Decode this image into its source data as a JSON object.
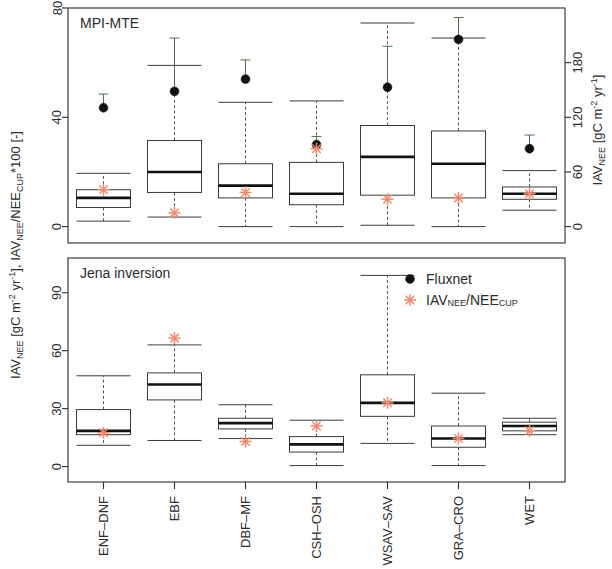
{
  "figure": {
    "left_axis_title": "IAV_NEE [gC m-2 yr-1], IAV_NEE/NEE_CUP*100 [-]",
    "right_axis_title": "IAV_NEE [gC m-2 yr-1]"
  },
  "legend": {
    "items": [
      {
        "label": "Fluxnet",
        "marker": "filled-circle",
        "color": "#111111"
      },
      {
        "label": "IAV_NEE/NEE_CUP",
        "marker": "asterisk",
        "color": "#f08a6e"
      }
    ]
  },
  "axis_text": {
    "left_part1": "IAV",
    "left_part1_sub": "NEE",
    "left_part2": " [gC m",
    "left_sup_m": "-2",
    "left_part3": " yr",
    "left_sup_y": "-1",
    "left_part4": "], IAV",
    "left_part4_sub": "NEE",
    "left_part5": "/NEE",
    "left_part5_sub": "CUP",
    "left_part6": "*100 [-]",
    "right_part1": "IAV",
    "right_part1_sub": "NEE",
    "right_part2": " [gC m",
    "right_sup_m": "-2",
    "right_part3": " yr",
    "right_sup_y": "-1",
    "right_part4": "]",
    "legend2_p1": "IAV",
    "legend2_s1": "NEE",
    "legend2_p2": "/NEE",
    "legend2_s2": "CUP"
  },
  "chart_data": [
    {
      "type": "box",
      "panel": "top",
      "title": "MPI-MTE",
      "xlabel": "",
      "ylabel": "IAV_NEE/NEE_CUP*100 [-]",
      "ylim": [
        -6,
        80
      ],
      "yticks": [
        0,
        40,
        80
      ],
      "y2label": "IAV_NEE [gC m-2 yr-1]",
      "y2lim": [
        -18,
        240
      ],
      "y2ticks": [
        0,
        60,
        120,
        180
      ],
      "grid": false,
      "categories": [
        "ENF-DNF",
        "EBF",
        "DBF-MF",
        "CSH-OSH",
        "WSAV-SAV",
        "GRA-CRO",
        "WET"
      ],
      "boxes": [
        {
          "category": "ENF-DNF",
          "whisker_low": 2.0,
          "q1": 7.0,
          "median": 10.5,
          "q3": 13.5,
          "whisker_high": 19.5
        },
        {
          "category": "EBF",
          "whisker_low": 3.5,
          "q1": 12.5,
          "median": 20.0,
          "q3": 31.5,
          "whisker_high": 59.0
        },
        {
          "category": "DBF-MF",
          "whisker_low": 0.0,
          "q1": 10.5,
          "median": 15.0,
          "q3": 23.0,
          "whisker_high": 45.5
        },
        {
          "category": "CSH-OSH",
          "whisker_low": 0.0,
          "q1": 8.0,
          "median": 12.0,
          "q3": 23.5,
          "whisker_high": 46.0
        },
        {
          "category": "WSAV-SAV",
          "whisker_low": 0.5,
          "q1": 11.5,
          "median": 25.5,
          "q3": 37.0,
          "whisker_high": 74.5
        },
        {
          "category": "GRA-CRO",
          "whisker_low": 0.0,
          "q1": 10.5,
          "median": 23.0,
          "q3": 35.0,
          "whisker_high": 69.0
        },
        {
          "category": "WET",
          "whisker_low": 6.0,
          "q1": 10.0,
          "median": 12.0,
          "q3": 14.5,
          "whisker_high": 20.5
        }
      ],
      "fluxnet_points": [
        {
          "category": "ENF-DNF",
          "value": 43.5,
          "err_high": 48.5
        },
        {
          "category": "EBF",
          "value": 49.5,
          "err_high": 69.0
        },
        {
          "category": "DBF-MF",
          "value": 54.0,
          "err_high": 61.0
        },
        {
          "category": "CSH-OSH",
          "value": 30.0,
          "err_high": 33.0
        },
        {
          "category": "WSAV-SAV",
          "value": 51.0,
          "err_high": 66.0
        },
        {
          "category": "GRA-CRO",
          "value": 68.5,
          "err_high": 76.5
        },
        {
          "category": "WET",
          "value": 28.5,
          "err_high": 33.5
        }
      ],
      "ratio_points": [
        {
          "category": "ENF-DNF",
          "value": 13.5
        },
        {
          "category": "EBF",
          "value": 5.0
        },
        {
          "category": "DBF-MF",
          "value": 12.5
        },
        {
          "category": "CSH-OSH",
          "value": 28.5
        },
        {
          "category": "WSAV-SAV",
          "value": 10.0
        },
        {
          "category": "GRA-CRO",
          "value": 10.5
        },
        {
          "category": "WET",
          "value": 12.0
        }
      ]
    },
    {
      "type": "box",
      "panel": "bottom",
      "title": "Jena inversion",
      "xlabel": "",
      "ylabel": "IAV_NEE [gC m-2 yr-1]",
      "ylim": [
        -8,
        108
      ],
      "yticks": [
        0,
        30,
        60,
        90
      ],
      "grid": false,
      "categories": [
        "ENF-DNF",
        "EBF",
        "DBF-MF",
        "CSH-OSH",
        "WSAV-SAV",
        "GRA-CRO",
        "WET"
      ],
      "boxes": [
        {
          "category": "ENF-DNF",
          "whisker_low": 11.0,
          "q1": 16.5,
          "median": 18.5,
          "q3": 29.5,
          "whisker_high": 47.0
        },
        {
          "category": "EBF",
          "whisker_low": 13.5,
          "q1": 34.5,
          "median": 42.5,
          "q3": 48.5,
          "whisker_high": 63.0
        },
        {
          "category": "DBF-MF",
          "whisker_low": 14.5,
          "q1": 19.5,
          "median": 22.5,
          "q3": 25.0,
          "whisker_high": 32.0
        },
        {
          "category": "CSH-OSH",
          "whisker_low": 0.5,
          "q1": 7.5,
          "median": 11.5,
          "q3": 15.5,
          "whisker_high": 24.0
        },
        {
          "category": "WSAV-SAV",
          "whisker_low": 12.0,
          "q1": 26.0,
          "median": 33.0,
          "q3": 47.5,
          "whisker_high": 99.0
        },
        {
          "category": "GRA-CRO",
          "whisker_low": 0.5,
          "q1": 10.0,
          "median": 14.5,
          "q3": 21.0,
          "whisker_high": 38.0
        },
        {
          "category": "WET",
          "whisker_low": 16.5,
          "q1": 18.5,
          "median": 21.0,
          "q3": 23.0,
          "whisker_high": 25.0
        }
      ],
      "ratio_points": [
        {
          "category": "ENF-DNF",
          "value": 17.5
        },
        {
          "category": "EBF",
          "value": 66.5
        },
        {
          "category": "DBF-MF",
          "value": 13.0
        },
        {
          "category": "CSH-OSH",
          "value": 21.0
        },
        {
          "category": "WSAV-SAV",
          "value": 33.0
        },
        {
          "category": "GRA-CRO",
          "value": 14.5
        },
        {
          "category": "WET",
          "value": 18.5
        }
      ]
    }
  ]
}
